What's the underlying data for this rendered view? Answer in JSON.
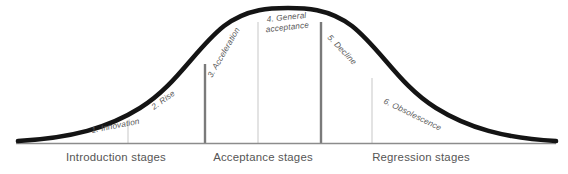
{
  "diagram": {
    "colors": {
      "curve": "#141414",
      "baseline": "#8c8c8c",
      "divider_major": "#7a7a7a",
      "divider_minor": "#cccccc",
      "stage_text": "#5a5a5a",
      "axis_text": "#555555",
      "background": "#ffffff"
    },
    "curve": {
      "type": "bell",
      "stroke_width": 4.6,
      "peak_x": 288,
      "peak_y": 11,
      "baseline_y": 143,
      "start_x": 18,
      "end_x": 556
    },
    "stages": [
      {
        "id": "innovation",
        "label": "1. Innovation",
        "x": 92,
        "y": 133,
        "rotation": -11,
        "lines": [
          "1. Innovation"
        ]
      },
      {
        "id": "rise",
        "label": "2. Rise",
        "x": 154,
        "y": 110,
        "rotation": -36,
        "lines": [
          "2. Rise"
        ]
      },
      {
        "id": "acceleration",
        "label": "3. Acceleration",
        "x": 212,
        "y": 78,
        "rotation": -60,
        "lines": [
          "3. Acceleration"
        ]
      },
      {
        "id": "general-acceptance",
        "label": "4. General acceptance",
        "x": 267,
        "y": 22,
        "rotation": -6,
        "lines": [
          "4. General",
          "acceptance"
        ]
      },
      {
        "id": "decline",
        "label": "5. Decline",
        "x": 327,
        "y": 38,
        "rotation": 46,
        "lines": [
          "5. Decline"
        ]
      },
      {
        "id": "obsolescence",
        "label": "6. Obsolescence",
        "x": 383,
        "y": 103,
        "rotation": 26,
        "lines": [
          "6. Obsolescence"
        ]
      }
    ],
    "dividers": [
      {
        "id": "divider-1",
        "x": 128,
        "top": 120,
        "weight": "minor"
      },
      {
        "id": "divider-2",
        "x": 205,
        "top": 64,
        "weight": "major"
      },
      {
        "id": "divider-3",
        "x": 258,
        "top": 22,
        "weight": "minor"
      },
      {
        "id": "divider-4",
        "x": 321,
        "top": 22,
        "weight": "major"
      },
      {
        "id": "divider-5",
        "x": 372,
        "top": 78,
        "weight": "minor"
      }
    ],
    "axis_groups": [
      {
        "id": "introduction",
        "label": "Introduction stages",
        "center_x": 116,
        "y": 160
      },
      {
        "id": "acceptance",
        "label": "Acceptance stages",
        "center_x": 263,
        "y": 160
      },
      {
        "id": "regression",
        "label": "Regression stages",
        "center_x": 421,
        "y": 160
      }
    ]
  }
}
